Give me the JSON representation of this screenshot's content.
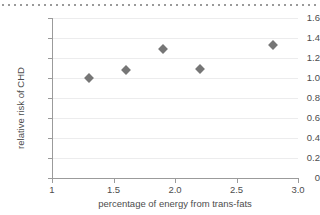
{
  "chart_data": {
    "type": "scatter",
    "title": "",
    "xlabel": "percentage of energy from trans-fats",
    "ylabel": "relative risk of CHD",
    "xlim": [
      1.0,
      3.0
    ],
    "ylim": [
      0.0,
      1.6
    ],
    "grid": "horizontal",
    "legend": "none",
    "marker": {
      "shape": "diamond",
      "color": "#767676",
      "size_px": 7
    },
    "x_ticks": [
      {
        "value": 1.0,
        "label": "1"
      },
      {
        "value": 1.5,
        "label": "1.5"
      },
      {
        "value": 2.0,
        "label": "2.0"
      },
      {
        "value": 2.5,
        "label": "2.5"
      },
      {
        "value": 3.0,
        "label": "3.0"
      }
    ],
    "y_ticks": [
      {
        "value": 0.0,
        "label": "0"
      },
      {
        "value": 0.2,
        "label": "0.2"
      },
      {
        "value": 0.4,
        "label": "0.4"
      },
      {
        "value": 0.6,
        "label": "0.6"
      },
      {
        "value": 0.8,
        "label": "0.8"
      },
      {
        "value": 1.0,
        "label": "1.0"
      },
      {
        "value": 1.2,
        "label": "1.2"
      },
      {
        "value": 1.4,
        "label": "1.4"
      },
      {
        "value": 1.6,
        "label": "1.6"
      }
    ],
    "x": [
      1.3,
      1.6,
      1.9,
      2.2,
      2.8
    ],
    "values": [
      1.0,
      1.08,
      1.29,
      1.09,
      1.33
    ],
    "points": [
      {
        "x": 1.3,
        "y": 1.0
      },
      {
        "x": 1.6,
        "y": 1.08
      },
      {
        "x": 1.9,
        "y": 1.29
      },
      {
        "x": 2.2,
        "y": 1.09
      },
      {
        "x": 2.8,
        "y": 1.33
      }
    ],
    "colors": {
      "marker": "#767676",
      "grid": "#ececed",
      "axis": "#9b9b9b",
      "text": "#4d4d4d",
      "top_rule": "#9a9a9a",
      "background": "#ffffff"
    }
  }
}
